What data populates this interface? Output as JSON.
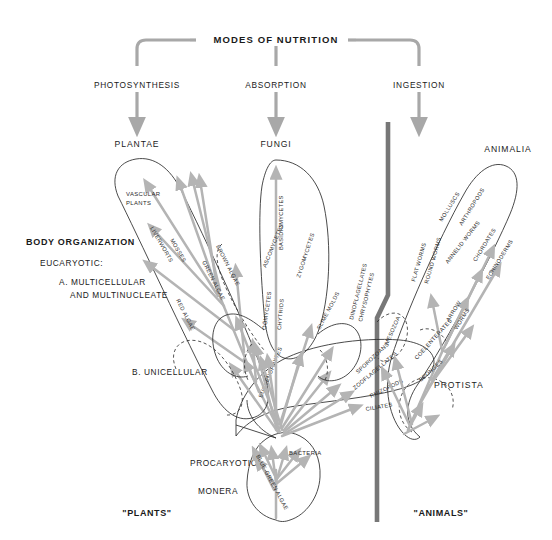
{
  "header": {
    "title": "MODES OF NUTRITION",
    "modes": [
      {
        "id": "photosynthesis",
        "label": "PHOTOSYNTHESIS"
      },
      {
        "id": "absorption",
        "label": "ABSORPTION"
      },
      {
        "id": "ingestion",
        "label": "INGESTION"
      }
    ]
  },
  "kingdoms": [
    {
      "id": "plantae",
      "label": "PLANTAE"
    },
    {
      "id": "fungi",
      "label": "FUNGI"
    },
    {
      "id": "animalia",
      "label": "ANIMALIA"
    },
    {
      "id": "protista",
      "label": "PROTISTA"
    },
    {
      "id": "monera",
      "label": "MONERA"
    }
  ],
  "side_labels": {
    "body_organization": "BODY ORGANIZATION",
    "eucaryotic": "EUCARYOTIC:",
    "multicellular": "A. MULTICELLULAR",
    "multinucleate": "AND MULTINUCLEATE",
    "unicellular": "B. UNICELLULAR",
    "procaryotic": "PROCARYOTIC"
  },
  "bottom_labels": {
    "plants": "\"PLANTS\"",
    "animals": "\"ANIMALS\""
  },
  "groups": {
    "plantae": [
      {
        "id": "vascular-plants",
        "label": "VASCULAR"
      },
      {
        "id": "vascular-plants-2",
        "label": "PLANTS"
      },
      {
        "id": "mosses",
        "label": "MOSSES"
      },
      {
        "id": "liverworts",
        "label": "LIVERWORTS"
      },
      {
        "id": "brown-algae",
        "label": "BROWN ALGAE"
      },
      {
        "id": "green-algae",
        "label": "GREEN ALGAE"
      },
      {
        "id": "red-algae",
        "label": "RED ALGAE"
      }
    ],
    "fungi": [
      {
        "id": "basidiomycetes",
        "label": "BASIDIOMYCETES"
      },
      {
        "id": "ascomycetes",
        "label": "ASCOMYCETES"
      },
      {
        "id": "zygomycetes",
        "label": "ZYGOMYCETES"
      },
      {
        "id": "oomycetes",
        "label": "OÖMYCETES"
      },
      {
        "id": "chytrids",
        "label": "CHYTRIDS"
      },
      {
        "id": "slime-molds",
        "label": "SLIME MOLDS"
      }
    ],
    "animalia": [
      {
        "id": "molluscs",
        "label": "MOLLUSCS"
      },
      {
        "id": "arthropods",
        "label": "ARTHROPODS"
      },
      {
        "id": "annelid-worms",
        "label": "ANNELID WORMS"
      },
      {
        "id": "chordates",
        "label": "CHORDATES"
      },
      {
        "id": "echinoderms",
        "label": "ECHINODERMS"
      },
      {
        "id": "arrow-worms",
        "label": "ARROW"
      },
      {
        "id": "arrow-worms-2",
        "label": "WORMS"
      },
      {
        "id": "flat-worms",
        "label": "FLAT WORMS"
      },
      {
        "id": "round-worms",
        "label": "ROUND WORMS"
      },
      {
        "id": "coelenterates",
        "label": "COELENTERATES"
      },
      {
        "id": "sponges",
        "label": "SPONGES"
      },
      {
        "id": "mesozoa",
        "label": "MESOZOA"
      }
    ],
    "protista": [
      {
        "id": "euglenophytes",
        "label": "EUGLENOPHYTES"
      },
      {
        "id": "dinoflagellates",
        "label": "DINOFLAGELLATES"
      },
      {
        "id": "chrysophytes",
        "label": "CHRYSOPHYTES"
      },
      {
        "id": "sporozoans",
        "label": "SPOROZOANS"
      },
      {
        "id": "zooflagellates",
        "label": "ZOOFLAGELLATES"
      },
      {
        "id": "rhizopods",
        "label": "RHIZOPODS"
      },
      {
        "id": "ciliates",
        "label": "CILIATES"
      }
    ],
    "monera": [
      {
        "id": "bacteria",
        "label": "BACTERIA"
      },
      {
        "id": "blue-green-algae",
        "label": "BLUE-GREEN ALGAE"
      }
    ]
  },
  "colors": {
    "branch": "#b4b4b4",
    "outline": "#2b2b2b",
    "divider": "#777777",
    "text": "#1a1a1a"
  }
}
